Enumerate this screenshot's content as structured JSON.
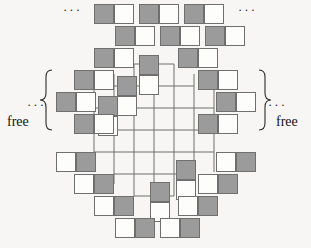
{
  "figure": {
    "name": "aztec-diamond-domino-tiling",
    "colors": {
      "shaded_cell": "#9b9b9b",
      "white_cell": "#fdfdfc",
      "cell_border": "#6f6f6f",
      "grid_line": "#6f6f6f",
      "background": "#f7f6f4",
      "text": "#131313"
    },
    "geometry": {
      "cell_size": 20,
      "origin_x": 14,
      "origin_y": 4,
      "columns": 14,
      "rows": 12
    },
    "inner_grid": {
      "left": 94,
      "top": 64,
      "cols": 7,
      "rows": 6
    },
    "annotations": {
      "ellipsis": "···",
      "free_left_label": "free",
      "free_right_label": "free",
      "brace_left": "{",
      "brace_right": "}"
    },
    "ellipses": [
      {
        "name": "ellipsis-top-left",
        "x": 63,
        "y": 5
      },
      {
        "name": "ellipsis-top-right",
        "x": 238,
        "y": 5
      },
      {
        "name": "ellipsis-left",
        "x": 27,
        "y": 100
      },
      {
        "name": "ellipsis-right",
        "x": 269,
        "y": 100
      }
    ],
    "labels": [
      {
        "name": "free-label-left",
        "text": "free",
        "x": 8,
        "y": 121
      },
      {
        "name": "free-label-right",
        "text": "free",
        "x": 275,
        "y": 121
      }
    ],
    "dominoes": [
      {
        "id": "d01",
        "orient": "h",
        "x": 94,
        "y": 4,
        "first": "g"
      },
      {
        "id": "d02",
        "orient": "h",
        "x": 139,
        "y": 4,
        "first": "g"
      },
      {
        "id": "d03",
        "orient": "h",
        "x": 184,
        "y": 4,
        "first": "g"
      },
      {
        "id": "d04",
        "orient": "h",
        "x": 115,
        "y": 26,
        "first": "g"
      },
      {
        "id": "d05",
        "orient": "h",
        "x": 160,
        "y": 26,
        "first": "g"
      },
      {
        "id": "d06",
        "orient": "h",
        "x": 205,
        "y": 26,
        "first": "g"
      },
      {
        "id": "d07",
        "orient": "h",
        "x": 94,
        "y": 48,
        "first": "g"
      },
      {
        "id": "d08",
        "orient": "h",
        "x": 178,
        "y": 48,
        "first": "g"
      },
      {
        "id": "d09",
        "orient": "v",
        "x": 139,
        "y": 55,
        "first": "g"
      },
      {
        "id": "d10",
        "orient": "h",
        "x": 74,
        "y": 70,
        "first": "g"
      },
      {
        "id": "d11",
        "orient": "h",
        "x": 198,
        "y": 70,
        "first": "g"
      },
      {
        "id": "d12",
        "orient": "v",
        "x": 117,
        "y": 76,
        "first": "g"
      },
      {
        "id": "d13",
        "orient": "h",
        "x": 56,
        "y": 92,
        "first": "g"
      },
      {
        "id": "d14",
        "orient": "h",
        "x": 216,
        "y": 92,
        "first": "g"
      },
      {
        "id": "d15",
        "orient": "v",
        "x": 98,
        "y": 96,
        "first": "g"
      },
      {
        "id": "d16",
        "orient": "h",
        "x": 74,
        "y": 114,
        "first": "g"
      },
      {
        "id": "d17",
        "orient": "h",
        "x": 198,
        "y": 114,
        "first": "g"
      },
      {
        "id": "d18",
        "orient": "h",
        "x": 56,
        "y": 152,
        "first": "w"
      },
      {
        "id": "d19",
        "orient": "h",
        "x": 216,
        "y": 152,
        "first": "w"
      },
      {
        "id": "d20",
        "orient": "h",
        "x": 74,
        "y": 174,
        "first": "w"
      },
      {
        "id": "d21",
        "orient": "h",
        "x": 198,
        "y": 174,
        "first": "w"
      },
      {
        "id": "d22",
        "orient": "v",
        "x": 176,
        "y": 160,
        "first": "g"
      },
      {
        "id": "d23",
        "orient": "h",
        "x": 94,
        "y": 196,
        "first": "w"
      },
      {
        "id": "d24",
        "orient": "h",
        "x": 178,
        "y": 196,
        "first": "w"
      },
      {
        "id": "d25",
        "orient": "v",
        "x": 150,
        "y": 182,
        "first": "g"
      },
      {
        "id": "d26",
        "orient": "h",
        "x": 115,
        "y": 218,
        "first": "w"
      },
      {
        "id": "d27",
        "orient": "h",
        "x": 160,
        "y": 218,
        "first": "w"
      }
    ]
  }
}
